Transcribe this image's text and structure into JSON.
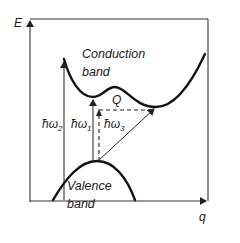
{
  "diagram": {
    "axes": {
      "y_label": "E",
      "x_label": "q"
    },
    "bands": {
      "conduction": {
        "line1": "Conduction",
        "line2": "band"
      },
      "valence": {
        "line1": "Valence",
        "line2": "band"
      }
    },
    "transitions": [
      {
        "id": "hw2",
        "symbol": "ħω",
        "subscript": "2",
        "type": "direct, vertical"
      },
      {
        "id": "hw1",
        "symbol": "ħω",
        "subscript": "1",
        "type": "direct, vertical"
      },
      {
        "id": "hw3",
        "symbol": "ħω",
        "subscript": "3",
        "type": "indirect, dashed vertical + horizontal"
      }
    ],
    "phonon_momentum_label": "Q",
    "colors": {
      "ink": "#111111",
      "background": "#ffffff"
    }
  }
}
